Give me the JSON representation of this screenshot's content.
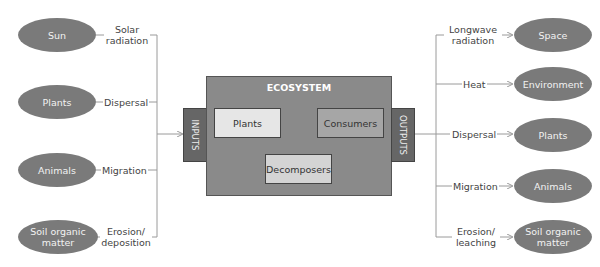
{
  "ecosystem": {
    "title": "ECOSYSTEM",
    "components": [
      "Plants",
      "Consumers",
      "Decomposers"
    ],
    "inputs_label": "INPUTS",
    "outputs_label": "OUTPUTS"
  },
  "inputs": [
    {
      "source": "Sun",
      "flow": "Solar radiation"
    },
    {
      "source": "Plants",
      "flow": "Dispersal"
    },
    {
      "source": "Animals",
      "flow": "Migration"
    },
    {
      "source": "Soil organic matter",
      "flow": "Erosion/ deposition"
    }
  ],
  "outputs": [
    {
      "flow": "Longwave radiation",
      "destination": "Space"
    },
    {
      "flow": "Heat",
      "destination": "Environment"
    },
    {
      "flow": "Dispersal",
      "destination": "Plants"
    },
    {
      "flow": "Migration",
      "destination": "Animals"
    },
    {
      "flow": "Erosion/ leaching",
      "destination": "Soil organic matter"
    }
  ],
  "colors": {
    "ellipse": "#7a7a7a",
    "ecosystem": "#8a8a8a",
    "side_tab": "#666666",
    "light_box": "#e6e6e6",
    "mid_box": "#a6a6a6",
    "line": "#9a9a9a"
  }
}
